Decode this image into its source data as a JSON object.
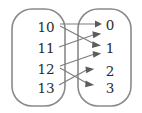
{
  "figure": {
    "type": "bipartite-mapping-diagram",
    "domain_set": {
      "name": "domain-oval",
      "items": [
        {
          "id": "d10",
          "label": "10",
          "x": 46,
          "y": 27
        },
        {
          "id": "d11",
          "label": "11",
          "x": 46,
          "y": 48
        },
        {
          "id": "d12",
          "label": "12",
          "x": 46,
          "y": 69
        },
        {
          "id": "d13",
          "label": "13",
          "x": 46,
          "y": 88
        }
      ]
    },
    "codomain_set": {
      "name": "codomain-oval",
      "items": [
        {
          "id": "c0",
          "label": "0",
          "x": 111,
          "y": 27
        },
        {
          "id": "c1",
          "label": "1",
          "x": 111,
          "y": 48
        },
        {
          "id": "c2",
          "label": "2",
          "x": 111,
          "y": 71
        },
        {
          "id": "c3",
          "label": "3",
          "x": 111,
          "y": 88
        }
      ]
    },
    "edges": [
      {
        "id": "e1",
        "from": "10",
        "to": "0",
        "x1": 60,
        "y1": 24,
        "x2": 97,
        "y2": 24
      },
      {
        "id": "e2",
        "from": "10",
        "to": "1",
        "x1": 60,
        "y1": 26,
        "x2": 97,
        "y2": 45
      },
      {
        "id": "e3",
        "from": "11",
        "to": "1",
        "x1": 60,
        "y1": 46,
        "x2": 97,
        "y2": 33
      },
      {
        "id": "e4",
        "from": "12",
        "to": "1",
        "x1": 60,
        "y1": 66,
        "x2": 97,
        "y2": 44
      },
      {
        "id": "e5",
        "from": "12",
        "to": "3",
        "x1": 60,
        "y1": 68,
        "x2": 97,
        "y2": 84
      },
      {
        "id": "e6",
        "from": "13",
        "to": "2",
        "x1": 60,
        "y1": 85,
        "x2": 97,
        "y2": 69
      }
    ],
    "colors": {
      "oval_stroke": "#8a8a8a",
      "edge_stroke": "#7d7d7d",
      "arrow_fill": "#5c5c5c",
      "label_text": "#2b2b2b",
      "background": "#ffffff"
    }
  }
}
